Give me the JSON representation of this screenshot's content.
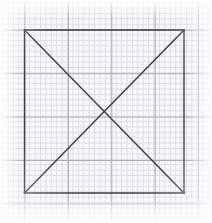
{
  "canvas": {
    "width": 212,
    "height": 223,
    "background_color": "#f8f8f9",
    "description": "Hand-drawn square with both diagonals on graph paper"
  },
  "grid": {
    "fine_spacing_px": 5.42,
    "fine_color": "#d9d9e2",
    "major_spacing_px": 43.4,
    "major_color": "#a8a8b4",
    "squares_per_major": 8
  },
  "figure": {
    "name": "square-with-diagonals",
    "stroke_color": "#3a3a44",
    "stroke_width_px": 1.4,
    "fill": "none",
    "square": {
      "left": 24.5,
      "top": 30,
      "right": 184,
      "bottom": 193,
      "width": 159.5,
      "height": 163
    },
    "vertices": {
      "top_left": [
        24.5,
        30
      ],
      "top_right": [
        184,
        30
      ],
      "bottom_right": [
        184,
        193
      ],
      "bottom_left": [
        24.5,
        193
      ]
    },
    "center": [
      104.25,
      111.5
    ],
    "edges": [
      {
        "name": "top-edge",
        "from": [
          24.5,
          30
        ],
        "to": [
          184,
          30
        ]
      },
      {
        "name": "right-edge",
        "from": [
          184,
          30
        ],
        "to": [
          184,
          193
        ]
      },
      {
        "name": "bottom-edge",
        "from": [
          184,
          193
        ],
        "to": [
          24.5,
          193
        ]
      },
      {
        "name": "left-edge",
        "from": [
          24.5,
          193
        ],
        "to": [
          24.5,
          30
        ]
      }
    ],
    "diagonals": [
      {
        "name": "diagonal-tl-br",
        "from": [
          24.5,
          30
        ],
        "to": [
          184,
          193
        ]
      },
      {
        "name": "diagonal-tr-bl",
        "from": [
          184,
          30
        ],
        "to": [
          24.5,
          193
        ]
      }
    ]
  }
}
